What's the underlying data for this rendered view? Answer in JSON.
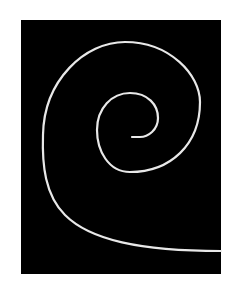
{
  "image": {
    "description": "White spiral curve on black rectangle",
    "background_color": "#ffffff",
    "panel_color": "#000000",
    "stroke_color": "#e8e8e8"
  }
}
